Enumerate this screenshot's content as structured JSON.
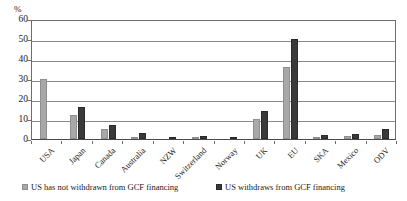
{
  "chart_data": {
    "type": "bar",
    "title": "",
    "xlabel": "",
    "ylabel": "%",
    "ylim": [
      0,
      60
    ],
    "yticks": [
      0,
      10,
      20,
      30,
      40,
      50,
      60
    ],
    "ytick_labels": [
      "0",
      "10",
      "20",
      "30",
      "40",
      "50",
      "60"
    ],
    "grid": true,
    "legend_position": "bottom",
    "categories": [
      "USA",
      "Japan",
      "Canada",
      "Australia",
      "NZW",
      "Switzerland",
      "Norway",
      "UK",
      "EU",
      "SKA",
      "Mexico",
      "ODV"
    ],
    "series": [
      {
        "name": "US has not withdrawn from GCF financing",
        "color": "#a8a8a8",
        "values": [
          30,
          12,
          5,
          1,
          0.3,
          1,
          0.3,
          10,
          36,
          1,
          1.5,
          2
        ]
      },
      {
        "name": "US withdraws from GCF financing",
        "color": "#3a3a3a",
        "values": [
          0,
          16,
          7,
          3,
          0.5,
          1.5,
          0.5,
          14,
          50,
          2,
          2.5,
          5
        ]
      }
    ]
  },
  "legend": {
    "items": [
      {
        "label": "US has not withdrawn from GCF financing"
      },
      {
        "label": "US withdraws from GCF financing"
      }
    ]
  }
}
